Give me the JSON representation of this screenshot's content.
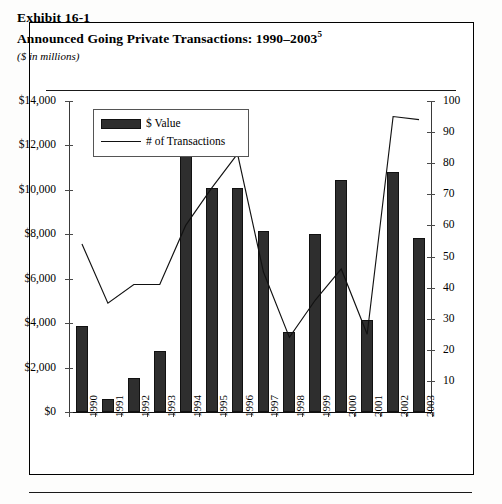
{
  "exhibit": {
    "number": "Exhibit 16-1",
    "title": "Announced Going Private Transactions: 1990–2003",
    "title_superscript": "5",
    "units_note": "($ in millions)"
  },
  "legend": {
    "bar_label": "$ Value",
    "line_label": "# of Transactions",
    "bar_swatch": "bar-swatch-icon",
    "line_swatch": "line-swatch-icon"
  },
  "axes": {
    "left_ticks": [
      "$14,000",
      "$12,000",
      "$10,000",
      "$8,000",
      "$6,000",
      "$4,000",
      "$2,000",
      "$0"
    ],
    "right_ticks": [
      "100",
      "90",
      "80",
      "70",
      "60",
      "50",
      "40",
      "30",
      "20",
      "10"
    ]
  },
  "colors": {
    "bar_fill": "#2e2e2e",
    "bar_stroke": "#111111",
    "line_stroke": "#111111",
    "axis": "#3a3a3a",
    "frame": "#000000",
    "background": "#ffffff"
  },
  "chart_data": {
    "type": "bar",
    "title": "Announced Going Private Transactions: 1990–2003",
    "subtitle": "($ in millions)",
    "xlabel": "",
    "ylabel": "$ Value",
    "y2label": "# of Transactions",
    "ylim": [
      0,
      14000
    ],
    "y2lim": [
      0,
      100
    ],
    "ytick_step": 2000,
    "y2tick_step": 10,
    "grid": false,
    "legend_position": "top-left",
    "categories": [
      "1990",
      "1991",
      "1992",
      "1993",
      "1994",
      "1995",
      "1996",
      "1997",
      "1998",
      "1999",
      "2000",
      "2001",
      "2002",
      "2003"
    ],
    "series": [
      {
        "name": "$ Value",
        "type": "bar",
        "axis": "left",
        "values": [
          3850,
          600,
          1550,
          2750,
          11750,
          10100,
          10100,
          8150,
          3600,
          8000,
          10450,
          4150,
          10800,
          7850
        ]
      },
      {
        "name": "# of Transactions",
        "type": "line",
        "axis": "right",
        "values": [
          54,
          35,
          41,
          41,
          60,
          72,
          83,
          45,
          24,
          36,
          46,
          25,
          95,
          94
        ]
      }
    ]
  }
}
